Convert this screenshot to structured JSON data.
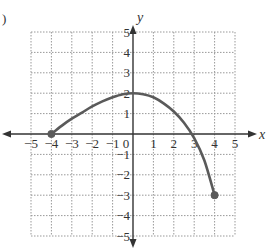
{
  "chart_data": {
    "type": "line",
    "title": "",
    "xlabel": "x",
    "ylabel": "y",
    "xlim": [
      -5,
      5
    ],
    "ylim": [
      -5,
      5
    ],
    "grid": true,
    "x_ticks": [
      -5,
      -4,
      -3,
      -2,
      -1,
      0,
      1,
      2,
      3,
      4,
      5
    ],
    "y_ticks": [
      -5,
      -4,
      -3,
      -2,
      -1,
      1,
      2,
      3,
      4,
      5
    ],
    "x_tick_labels": [
      "−5",
      "−4",
      "−3",
      "−2",
      "−1",
      "0",
      "1",
      "2",
      "3",
      "4",
      "5"
    ],
    "y_tick_labels": [
      "−5",
      "−4",
      "−3",
      "−2",
      "−1",
      "1",
      "2",
      "3",
      "4",
      "5"
    ],
    "series": [
      {
        "name": "f(x)",
        "x": [
          -4,
          -3.5,
          -3,
          -2.5,
          -2,
          -1.5,
          -1,
          -0.5,
          0,
          0.5,
          1,
          1.5,
          2,
          2.5,
          3,
          3.5,
          4
        ],
        "y": [
          0,
          0.4,
          0.75,
          1.05,
          1.35,
          1.6,
          1.8,
          1.95,
          2,
          1.95,
          1.8,
          1.5,
          1.1,
          0.55,
          -0.2,
          -1.3,
          -3
        ]
      }
    ],
    "endpoints": [
      {
        "x": -4,
        "y": 0,
        "style": "closed"
      },
      {
        "x": 4,
        "y": -3,
        "style": "closed"
      }
    ],
    "colors": {
      "curve": "#5a5a5a",
      "axis": "#333333",
      "grid": "#999999"
    }
  },
  "labels": {
    "x_axis": "x",
    "y_axis": "y",
    "panel_marker": ")"
  }
}
